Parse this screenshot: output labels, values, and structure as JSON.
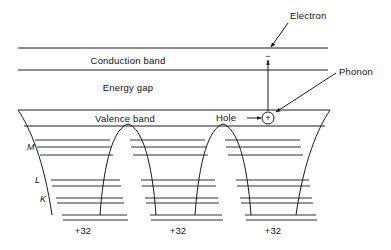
{
  "figure": {
    "bands": {
      "conduction_label": "Conduction band",
      "gap_label": "Energy gap",
      "valence_label": "Valence band"
    },
    "annotations": {
      "electron": "Electron",
      "phonon": "Phonon",
      "hole": "Hole",
      "electron_sign": "−",
      "hole_sign": "+"
    },
    "shells": [
      {
        "id": "M",
        "label": "M"
      },
      {
        "id": "L",
        "label": "L"
      },
      {
        "id": "K",
        "label": "K"
      }
    ],
    "nuclei": [
      {
        "label": "+32"
      },
      {
        "label": "+32"
      },
      {
        "label": "+32"
      }
    ],
    "colors": {
      "line": "#1a1a1a",
      "text": "#111111",
      "background": "#ffffff"
    }
  }
}
